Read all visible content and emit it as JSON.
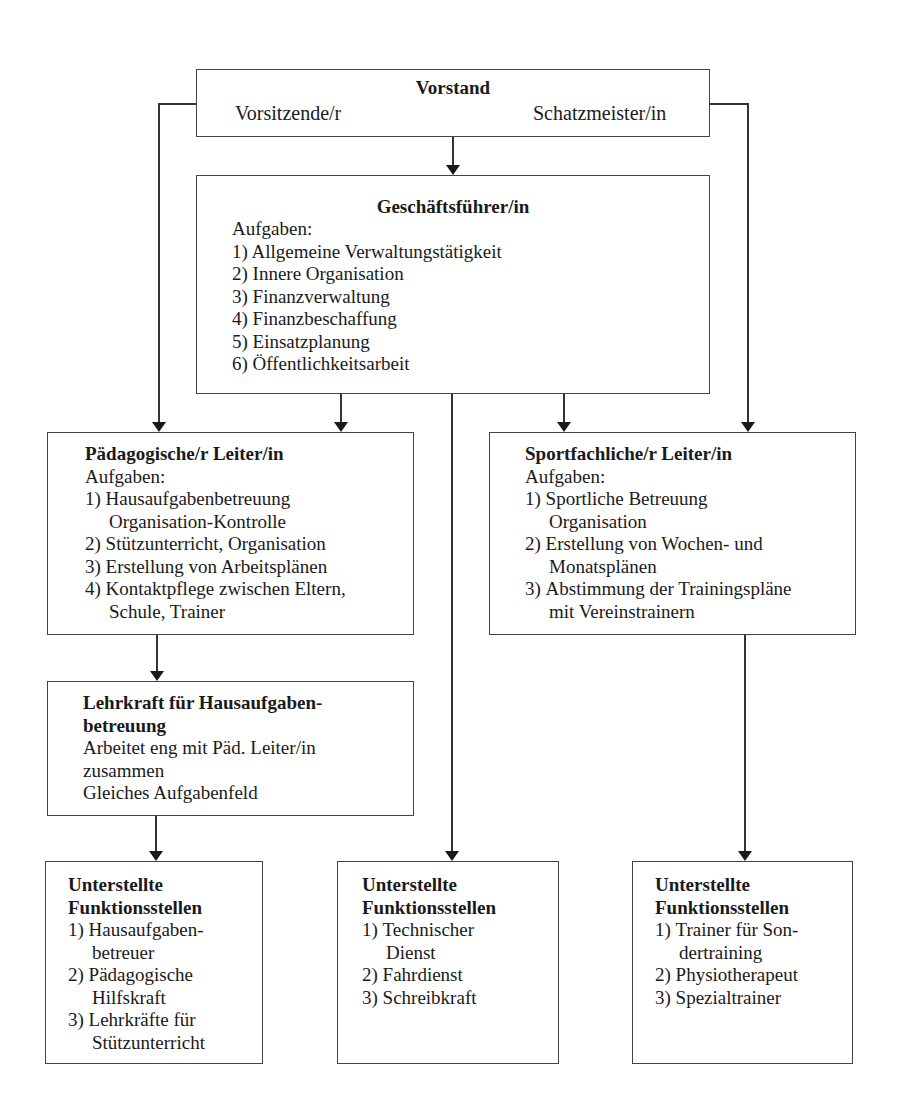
{
  "vorstand": {
    "title": "Vorstand",
    "left": "Vorsitzende/r",
    "right": "Schatzmeister/in"
  },
  "geschaeftsfuehrer": {
    "title": "Geschäftsführer/in",
    "subtitle": "Aufgaben:",
    "items": [
      "1) Allgemeine Verwaltungstätigkeit",
      "2) Innere Organisation",
      "3) Finanzverwaltung",
      "4) Finanzbeschaffung",
      "5) Einsatzplanung",
      "6) Öffentlichkeitsarbeit"
    ]
  },
  "paed_leiter": {
    "title": "Pädagogische/r Leiter/in",
    "subtitle": "Aufgaben:",
    "items": [
      {
        "num": "1)",
        "lines": [
          "Hausaufgabenbetreuung",
          "Organisation-Kontrolle"
        ]
      },
      {
        "num": "2)",
        "lines": [
          "Stützunterricht, Organisation"
        ]
      },
      {
        "num": "3)",
        "lines": [
          "Erstellung von Arbeitsplänen"
        ]
      },
      {
        "num": "4)",
        "lines": [
          "Kontaktpflege zwischen Eltern,",
          "Schule, Trainer"
        ]
      }
    ]
  },
  "sport_leiter": {
    "title": "Sportfachliche/r Leiter/in",
    "subtitle": "Aufgaben:",
    "items": [
      {
        "num": "1)",
        "lines": [
          "Sportliche Betreuung",
          "Organisation"
        ]
      },
      {
        "num": "2)",
        "lines": [
          "Erstellung von Wochen- und",
          "Monatsplänen"
        ]
      },
      {
        "num": "3)",
        "lines": [
          "Abstimmung der Trainingspläne",
          "mit Vereinstrainern"
        ]
      }
    ]
  },
  "lehrkraft": {
    "title_line1": "Lehrkraft für Hausaufgaben-",
    "title_line2": "betreuung",
    "lines": [
      "Arbeitet eng mit Päd. Leiter/in",
      "zusammen",
      "Gleiches Aufgabenfeld"
    ]
  },
  "funktion_left": {
    "title_line1": "Unterstellte",
    "title_line2": "Funktionsstellen",
    "items": [
      {
        "num": "1)",
        "lines": [
          "Hausaufgaben-",
          "betreuer"
        ]
      },
      {
        "num": "2)",
        "lines": [
          "Pädagogische",
          "Hilfskraft"
        ]
      },
      {
        "num": "3)",
        "lines": [
          "Lehrkräfte für",
          "Stützunterricht"
        ]
      }
    ]
  },
  "funktion_mid": {
    "title_line1": "Unterstellte",
    "title_line2": "Funktionsstellen",
    "items": [
      {
        "num": "1)",
        "lines": [
          "Technischer",
          "Dienst"
        ]
      },
      {
        "num": "2)",
        "lines": [
          "Fahrdienst"
        ]
      },
      {
        "num": "3)",
        "lines": [
          "Schreibkraft"
        ]
      }
    ]
  },
  "funktion_right": {
    "title_line1": "Unterstellte",
    "title_line2": "Funktionsstellen",
    "items": [
      {
        "num": "1)",
        "lines": [
          "Trainer für Son-",
          "dertraining"
        ]
      },
      {
        "num": "2)",
        "lines": [
          "Physiotherapeut"
        ]
      },
      {
        "num": "3)",
        "lines": [
          "Spezialtrainer"
        ]
      }
    ]
  }
}
